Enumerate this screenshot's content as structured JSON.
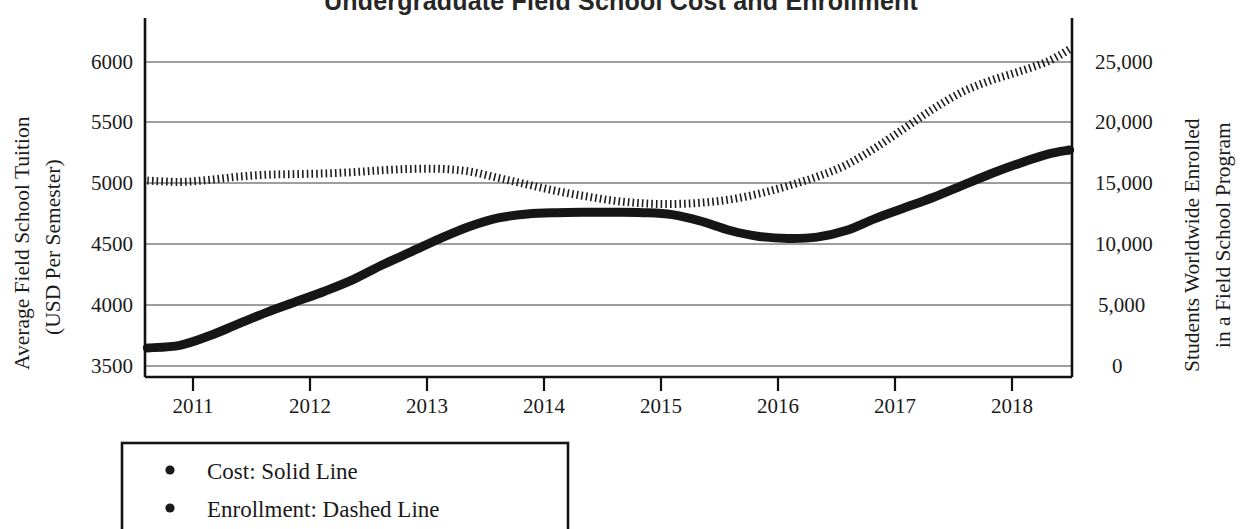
{
  "chart_data": {
    "type": "line",
    "title": "Undergraduate Field School Cost and Enrollment",
    "xlabel": "",
    "x_tick_labels": [
      "2011",
      "2012",
      "2013",
      "2014",
      "2015",
      "2016",
      "2017",
      "2018"
    ],
    "x": [
      2011,
      2012,
      2013,
      2014,
      2015,
      2016,
      2017,
      2018
    ],
    "xlim": [
      2010.6,
      2018.6
    ],
    "grid": true,
    "legend_position": "below-left",
    "axes": {
      "left": {
        "label": "Average Field School Tuition (USD Per Semester)",
        "label_line1": "Average Field School Tuition",
        "label_line2": "(USD Per Semester)",
        "ticks": [
          3500,
          4000,
          4500,
          5000,
          5500,
          6000
        ],
        "tick_labels": [
          "3500",
          "4000",
          "4500",
          "5000",
          "5500",
          "6000"
        ],
        "ylim": [
          3340,
          6060
        ]
      },
      "right": {
        "label": "Students Worldwide Enrolled in a Field School Program",
        "label_line1": "Students Worldwide Enrolled",
        "label_line2": "in a Field School Program",
        "ticks": [
          0,
          5000,
          10000,
          15000,
          20000,
          25000
        ],
        "tick_labels": [
          "0",
          "5,000",
          "10,000",
          "15,000",
          "20,000",
          "25,000"
        ],
        "ylim": [
          -1600,
          26000
        ]
      }
    },
    "series": [
      {
        "name": "Cost",
        "style": "solid",
        "axis": "left",
        "legend_label": "Cost: Solid Line",
        "x": [
          2010.62,
          2010.9,
          2011.15,
          2011.4,
          2011.65,
          2011.9,
          2012.15,
          2012.4,
          2012.65,
          2012.9,
          2013.15,
          2013.4,
          2013.65,
          2013.9,
          2014.15,
          2014.4,
          2014.65,
          2014.9,
          2015.15,
          2015.4,
          2015.65,
          2015.9,
          2016.15,
          2016.4,
          2016.65,
          2016.9,
          2017.15,
          2017.4,
          2017.65,
          2017.9,
          2018.15,
          2018.4,
          2018.58
        ],
        "values": [
          3560,
          3580,
          3650,
          3740,
          3830,
          3910,
          3990,
          4080,
          4190,
          4290,
          4390,
          4480,
          4545,
          4575,
          4585,
          4588,
          4588,
          4585,
          4570,
          4520,
          4450,
          4405,
          4390,
          4400,
          4450,
          4540,
          4620,
          4700,
          4790,
          4880,
          4960,
          5030,
          5060
        ]
      },
      {
        "name": "Enrollment",
        "style": "dashed",
        "axis": "right",
        "legend_label": "Enrollment: Dashed Line",
        "x": [
          2010.62,
          2010.9,
          2011.15,
          2011.4,
          2011.65,
          2011.9,
          2012.15,
          2012.4,
          2012.65,
          2012.9,
          2013.15,
          2013.4,
          2013.65,
          2013.9,
          2014.15,
          2014.4,
          2014.65,
          2014.9,
          2015.15,
          2015.4,
          2015.65,
          2015.9,
          2016.15,
          2016.4,
          2016.65,
          2016.9,
          2017.15,
          2017.4,
          2017.65,
          2017.9,
          2018.15,
          2018.4,
          2018.58
        ],
        "values": [
          13500,
          13400,
          13550,
          13800,
          13950,
          14000,
          14050,
          14150,
          14300,
          14400,
          14400,
          14200,
          13700,
          13200,
          12700,
          12300,
          11950,
          11750,
          11700,
          11800,
          12050,
          12500,
          13100,
          13800,
          14700,
          16000,
          17500,
          19000,
          20300,
          21200,
          21900,
          22700,
          23600
        ]
      }
    ],
    "cost_final_value": 5320,
    "enrollment_final_value": 24800,
    "legend_items": [
      {
        "bullet": "•",
        "label": "Cost: Solid Line"
      },
      {
        "bullet": "•",
        "label": "Enrollment: Dashed Line"
      }
    ]
  }
}
